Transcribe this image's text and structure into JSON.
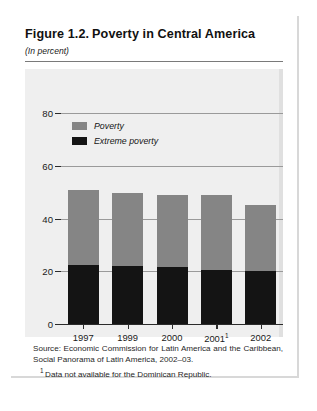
{
  "figure": {
    "number": "Figure 1.2.",
    "title": "Poverty in Central America",
    "subtitle": "(In percent)"
  },
  "legend": {
    "position": "top-left-inside",
    "items": [
      {
        "label": "Poverty",
        "color": "#858585",
        "swatch": "gray-square-icon"
      },
      {
        "label": "Extreme poverty",
        "color": "#141414",
        "swatch": "black-square-icon"
      }
    ]
  },
  "notes": {
    "source": "Source: Economic Commission for Latin America and the Caribbean, Social Panorama of Latin America, 2002–03.",
    "footnote_marker": "1",
    "footnote": "Data not available for the Dominican Republic."
  },
  "chart_data": {
    "type": "bar",
    "stacked": true,
    "subtitle": "(In percent)",
    "xlabel": "",
    "ylabel": "",
    "ylim": [
      0,
      80
    ],
    "yticks": [
      0,
      20,
      40,
      60,
      80
    ],
    "ytick_labels": [
      "0",
      "20",
      "40",
      "60",
      "80"
    ],
    "grid": true,
    "grid_axis": "y",
    "categories": [
      "1997",
      "1999",
      "2000",
      "2001",
      "2002"
    ],
    "category_labels": [
      "1997",
      "1999",
      "2000",
      "2001¹",
      "2002"
    ],
    "series": [
      {
        "name": "Poverty",
        "color": "#858585",
        "values": [
          51,
          49.5,
          49,
          49,
          45
        ]
      },
      {
        "name": "Extreme poverty",
        "color": "#141414",
        "values": [
          22.5,
          22,
          21.5,
          20.5,
          20
        ]
      }
    ]
  }
}
